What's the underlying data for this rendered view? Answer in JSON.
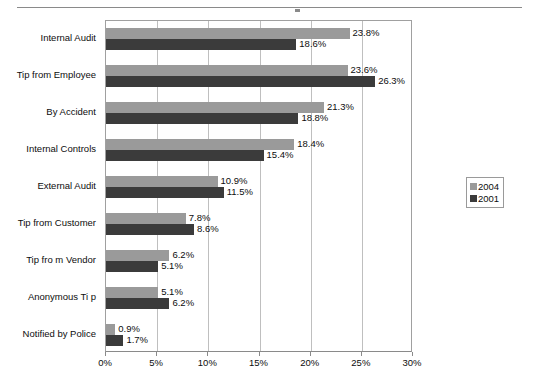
{
  "chart_data": {
    "type": "bar",
    "orientation": "horizontal",
    "title": "",
    "xlabel": "",
    "ylabel": "",
    "xlim": [
      0,
      30
    ],
    "xticks": [
      "0%",
      "5%",
      "10%",
      "15%",
      "20%",
      "25%",
      "30%"
    ],
    "xtick_values": [
      0,
      5,
      10,
      15,
      20,
      25,
      30
    ],
    "grid": true,
    "legend_position": "right",
    "categories": [
      "Internal Audit",
      "Tip from Employee",
      "By Accident",
      "Internal Controls",
      "External Audit",
      "Tip from Customer",
      "Tip fro m Vendor",
      "Anonymous Ti p",
      "Notified by Police"
    ],
    "series": [
      {
        "name": "2004",
        "color": "#9a9a9a",
        "values": [
          23.8,
          23.6,
          21.3,
          18.4,
          10.9,
          7.8,
          6.2,
          5.1,
          0.9
        ],
        "labels": [
          "23.8%",
          "23.6%",
          "21.3%",
          "18.4%",
          "10.9%",
          "7.8%",
          "6.2%",
          "5.1%",
          "0.9%"
        ]
      },
      {
        "name": "2001",
        "color": "#3b3b3b",
        "values": [
          18.6,
          26.3,
          18.8,
          15.4,
          11.5,
          8.6,
          5.1,
          6.2,
          1.7
        ],
        "labels": [
          "18.6%",
          "26.3%",
          "18.8%",
          "15.4%",
          "11.5%",
          "8.6%",
          "5.1%",
          "6.2%",
          "1.7%"
        ]
      }
    ]
  },
  "legend": {
    "items": [
      {
        "label": "2004",
        "color": "#9a9a9a"
      },
      {
        "label": "2001",
        "color": "#3b3b3b"
      }
    ]
  },
  "colors": {
    "series_2004": "#9a9a9a",
    "series_2001": "#3b3b3b",
    "gridline": "#bfbfbf",
    "axis": "#8a8a8a",
    "text": "#0d0d0d",
    "background": "#ffffff"
  }
}
